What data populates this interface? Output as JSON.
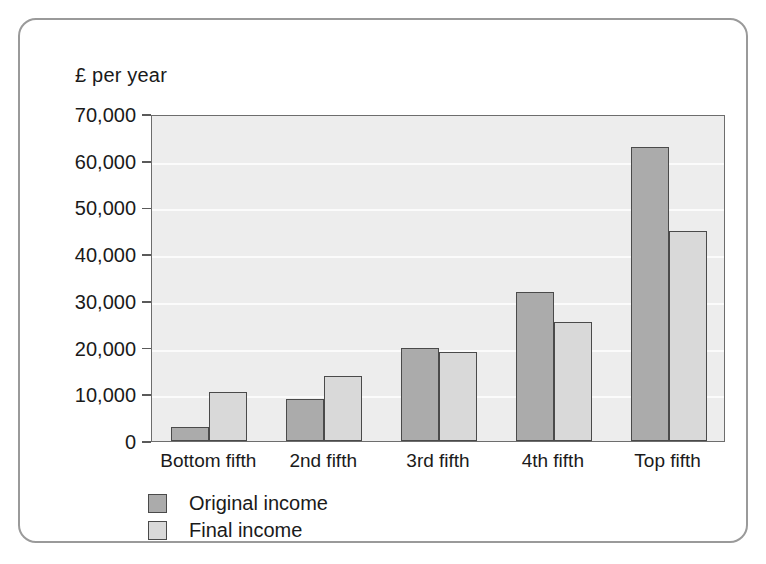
{
  "chart_data": {
    "type": "bar",
    "title": "",
    "subtitle": "",
    "xlabel": "",
    "ylabel": "£ per year",
    "ylim": [
      0,
      70000
    ],
    "ytick_labels": [
      "0",
      "10,000",
      "20,000",
      "30,000",
      "40,000",
      "50,000",
      "60,000",
      "70,000"
    ],
    "ytick_values": [
      0,
      10000,
      20000,
      30000,
      40000,
      50000,
      60000,
      70000
    ],
    "grid": true,
    "legend_position": "below-left",
    "categories": [
      "Bottom fifth",
      "2nd fifth",
      "3rd fifth",
      "4th fifth",
      "Top fifth"
    ],
    "series": [
      {
        "name": "Original income",
        "color": "#ababab",
        "values": [
          3000,
          9000,
          20000,
          32000,
          63000
        ]
      },
      {
        "name": "Final income",
        "color": "#d9d9d9",
        "values": [
          10500,
          14000,
          19000,
          25500,
          45000
        ]
      }
    ]
  },
  "colors": {
    "plot_background": "#ededed",
    "gridline": "#fbfbfb",
    "bar_outline": "#4a4a4a",
    "axis_line": "#6d6d6d",
    "frame_border": "#9a9a9a",
    "text": "#1a1a1a"
  }
}
